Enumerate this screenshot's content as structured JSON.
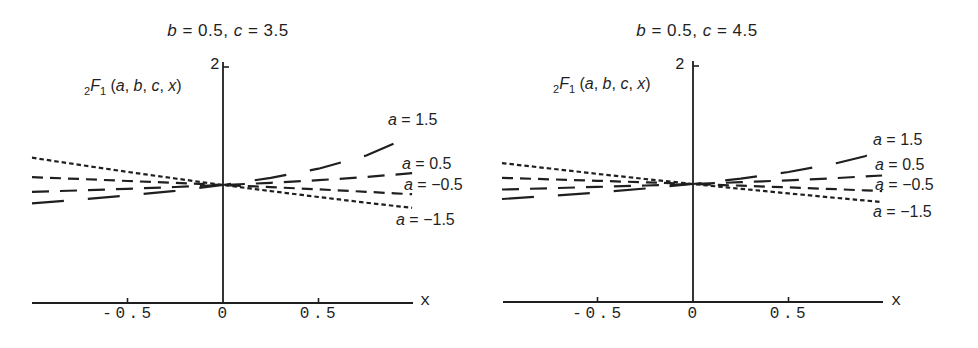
{
  "background_color": "#ffffff",
  "ink_color": "#1f1f1f",
  "chart_data": [
    {
      "type": "line",
      "title": "b = 0.5, c = 3.5",
      "title_segments": [
        {
          "text": "b",
          "italic": true
        },
        {
          "text": " = 0.5, "
        },
        {
          "text": "c",
          "italic": true
        },
        {
          "text": " = 3.5"
        }
      ],
      "params": {
        "b": 0.5,
        "c": 3.5
      },
      "ylabel": "2F1(a, b, c, x)",
      "ylabel_segments": [
        {
          "text": "2",
          "sub": true
        },
        {
          "text": "F",
          "italic": true
        },
        {
          "text": "1",
          "sub": true
        },
        {
          "text": " ("
        },
        {
          "text": "a",
          "italic": true
        },
        {
          "text": ", "
        },
        {
          "text": "b",
          "italic": true
        },
        {
          "text": ", "
        },
        {
          "text": "c",
          "italic": true
        },
        {
          "text": ", "
        },
        {
          "text": "x",
          "italic": true
        },
        {
          "text": ")"
        }
      ],
      "xlabel": "x",
      "xlim": [
        -1,
        1
      ],
      "ylim": [
        0,
        2
      ],
      "x_ticks": [
        {
          "label": "-0.5",
          "value": -0.5
        },
        {
          "label": "0",
          "value": 0
        },
        {
          "label": "0.5",
          "value": 0.5
        }
      ],
      "y_ticks": [
        {
          "label": "2",
          "value": 2
        }
      ],
      "x": [
        -1,
        -0.75,
        -0.5,
        -0.25,
        0,
        0.25,
        0.5,
        0.75,
        0.9,
        0.99
      ],
      "series": [
        {
          "name": "a = 1.5",
          "a": 1.5,
          "dash": [
            32,
            24
          ],
          "label_segments": [
            {
              "text": "a",
              "italic": true
            },
            {
              "text": " = 1.5"
            }
          ],
          "values": [
            0.845,
            0.876,
            0.911,
            0.951,
            1.0,
            1.06,
            1.138,
            1.25,
            1.354,
            1.45
          ]
        },
        {
          "name": "a = 0.5",
          "a": 0.5,
          "dash": [
            17,
            11
          ],
          "label_segments": [
            {
              "text": "a",
              "italic": true
            },
            {
              "text": " = 0.5"
            }
          ],
          "values": [
            0.942,
            0.954,
            0.968,
            0.983,
            1.0,
            1.019,
            1.041,
            1.068,
            1.088,
            1.101
          ]
        },
        {
          "name": "a = -0.5",
          "a": -0.5,
          "dash": [
            11,
            7
          ],
          "label_segments": [
            {
              "text": "a",
              "italic": true
            },
            {
              "text": " = −0.5"
            }
          ],
          "values": [
            1.067,
            1.051,
            1.034,
            1.018,
            1.0,
            0.982,
            0.963,
            0.942,
            0.929,
            0.922
          ]
        },
        {
          "name": "a = -1.5",
          "a": -1.5,
          "dash": [
            4.5,
            3
          ],
          "label_segments": [
            {
              "text": "a",
              "italic": true
            },
            {
              "text": " = −1.5"
            }
          ],
          "values": [
            1.231,
            1.17,
            1.111,
            1.055,
            1.0,
            0.948,
            0.898,
            0.85,
            0.823,
            0.807
          ]
        }
      ],
      "legend_position": "right-of-curves"
    },
    {
      "type": "line",
      "title": "b = 0.5, c = 4.5",
      "title_segments": [
        {
          "text": "b",
          "italic": true
        },
        {
          "text": " = 0.5, "
        },
        {
          "text": "c",
          "italic": true
        },
        {
          "text": " = 4.5"
        }
      ],
      "params": {
        "b": 0.5,
        "c": 4.5
      },
      "ylabel": "2F1(a, b, c, x)",
      "ylabel_segments": [
        {
          "text": "2",
          "sub": true
        },
        {
          "text": "F",
          "italic": true
        },
        {
          "text": "1",
          "sub": true
        },
        {
          "text": " ("
        },
        {
          "text": "a",
          "italic": true
        },
        {
          "text": ", "
        },
        {
          "text": "b",
          "italic": true
        },
        {
          "text": ", "
        },
        {
          "text": "c",
          "italic": true
        },
        {
          "text": ", "
        },
        {
          "text": "x",
          "italic": true
        },
        {
          "text": ")"
        }
      ],
      "xlabel": "x",
      "xlim": [
        -1,
        1
      ],
      "ylim": [
        0,
        2
      ],
      "x_ticks": [
        {
          "label": "-0.5",
          "value": -0.5
        },
        {
          "label": "0",
          "value": 0
        },
        {
          "label": "0.5",
          "value": 0.5
        }
      ],
      "y_ticks": [
        {
          "label": "2",
          "value": 2
        }
      ],
      "x": [
        -1,
        -0.75,
        -0.5,
        -0.25,
        0,
        0.25,
        0.5,
        0.75,
        0.9,
        0.99
      ],
      "series": [
        {
          "name": "a = 1.5",
          "a": 1.5,
          "dash": [
            32,
            24
          ],
          "label_segments": [
            {
              "text": "a",
              "italic": true
            },
            {
              "text": " = 1.5"
            }
          ],
          "values": [
            0.873,
            0.899,
            0.928,
            0.962,
            1.0,
            1.046,
            1.102,
            1.176,
            1.236,
            1.282
          ]
        },
        {
          "name": "a = 0.5",
          "a": 0.5,
          "dash": [
            17,
            11
          ],
          "label_segments": [
            {
              "text": "a",
              "italic": true
            },
            {
              "text": " = 0.5"
            }
          ],
          "values": [
            0.953,
            0.964,
            0.975,
            0.987,
            1.0,
            1.015,
            1.031,
            1.05,
            1.064,
            1.072
          ]
        },
        {
          "name": "a = -0.5",
          "a": -0.5,
          "dash": [
            11,
            7
          ],
          "label_segments": [
            {
              "text": "a",
              "italic": true
            },
            {
              "text": " = −0.5"
            }
          ],
          "values": [
            1.052,
            1.04,
            1.027,
            1.014,
            1.0,
            0.986,
            0.971,
            0.956,
            0.946,
            0.94
          ]
        },
        {
          "name": "a = -1.5",
          "a": -1.5,
          "dash": [
            4.5,
            3
          ],
          "label_segments": [
            {
              "text": "a",
              "italic": true
            },
            {
              "text": " = −1.5"
            }
          ],
          "values": [
            1.177,
            1.131,
            1.086,
            1.042,
            1.0,
            0.959,
            0.92,
            0.882,
            0.86,
            0.847
          ]
        }
      ],
      "legend_position": "right-of-curves"
    }
  ]
}
